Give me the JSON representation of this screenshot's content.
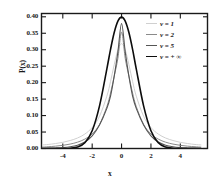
{
  "chart_data": {
    "type": "line",
    "title": "",
    "xlabel": "x",
    "ylabel": "P(x)",
    "xlim": [
      -5.45,
      5.85
    ],
    "ylim": [
      0.0,
      0.41
    ],
    "xticks": [
      -4,
      -2,
      0,
      2,
      4
    ],
    "xtick_labels": [
      "-4",
      "-2",
      "0",
      "2",
      "4"
    ],
    "yticks": [
      0.0,
      0.05,
      0.1,
      0.15,
      0.2,
      0.25,
      0.3,
      0.35,
      0.4
    ],
    "ytick_labels": [
      "0.00",
      "0.05",
      "0.10",
      "0.15",
      "0.20",
      "0.25",
      "0.30",
      "0.35",
      "0.40"
    ],
    "grid": false,
    "legend_position": "upper-right",
    "series": [
      {
        "name": "ν = 1",
        "nu": 1,
        "color": "#d0d0d0",
        "linewidth": 1.0,
        "peak": 0.3183,
        "x": [
          -5.4,
          -5.0,
          -4.5,
          -4.0,
          -3.5,
          -3.0,
          -2.5,
          -2.0,
          -1.5,
          -1.0,
          -0.75,
          -0.5,
          -0.25,
          0.0,
          0.25,
          0.5,
          0.75,
          1.0,
          1.5,
          2.0,
          2.5,
          3.0,
          3.5,
          4.0,
          4.5,
          5.0,
          5.4
        ],
        "y": [
          0.0108,
          0.0122,
          0.015,
          0.0187,
          0.0243,
          0.0318,
          0.0439,
          0.0637,
          0.0979,
          0.1592,
          0.2037,
          0.2546,
          0.2995,
          0.3183,
          0.2995,
          0.2546,
          0.2037,
          0.1592,
          0.0979,
          0.0637,
          0.0439,
          0.0318,
          0.0243,
          0.0187,
          0.015,
          0.0122,
          0.0108
        ]
      },
      {
        "name": "ν = 2",
        "nu": 2,
        "color": "#8a8a8a",
        "linewidth": 1.0,
        "peak": 0.3536,
        "x": [
          -5.4,
          -5.0,
          -4.5,
          -4.0,
          -3.5,
          -3.0,
          -2.5,
          -2.0,
          -1.5,
          -1.0,
          -0.75,
          -0.5,
          -0.25,
          0.0,
          0.25,
          0.5,
          0.75,
          1.0,
          1.5,
          2.0,
          2.5,
          3.0,
          3.5,
          4.0,
          4.5,
          5.0,
          5.4
        ],
        "y": [
          0.0042,
          0.0053,
          0.0071,
          0.0096,
          0.0134,
          0.0192,
          0.0285,
          0.0442,
          0.0731,
          0.1275,
          0.1686,
          0.2195,
          0.2736,
          0.3536,
          0.2736,
          0.2195,
          0.1686,
          0.1275,
          0.0731,
          0.0442,
          0.0285,
          0.0192,
          0.0134,
          0.0096,
          0.0071,
          0.0053,
          0.0042
        ]
      },
      {
        "name": "ν = 5",
        "nu": 5,
        "color": "#555555",
        "linewidth": 1.1,
        "peak": 0.3796,
        "x": [
          -5.4,
          -5.0,
          -4.5,
          -4.0,
          -3.5,
          -3.0,
          -2.5,
          -2.0,
          -1.5,
          -1.0,
          -0.75,
          -0.5,
          -0.25,
          0.0,
          0.25,
          0.5,
          0.75,
          1.0,
          1.5,
          2.0,
          2.5,
          3.0,
          3.5,
          4.0,
          4.5,
          5.0,
          5.4
        ],
        "y": [
          0.0007,
          0.001,
          0.0017,
          0.0028,
          0.0051,
          0.0098,
          0.0195,
          0.0384,
          0.0715,
          0.122,
          0.1592,
          0.2197,
          0.2934,
          0.3796,
          0.2934,
          0.2197,
          0.1592,
          0.122,
          0.0715,
          0.0384,
          0.0195,
          0.0098,
          0.0051,
          0.0028,
          0.0017,
          0.001,
          0.0007
        ]
      },
      {
        "name": "ν = + ∞",
        "nu": "infinity",
        "color": "#0d0d0d",
        "linewidth": 1.6,
        "peak": 0.3989,
        "x": [
          -5.4,
          -5.0,
          -4.5,
          -4.0,
          -3.5,
          -3.0,
          -2.5,
          -2.0,
          -1.5,
          -1.0,
          -0.75,
          -0.5,
          -0.25,
          0.0,
          0.25,
          0.5,
          0.75,
          1.0,
          1.5,
          2.0,
          2.5,
          3.0,
          3.5,
          4.0,
          4.5,
          5.0,
          5.4
        ],
        "y": [
          0.0,
          0.0,
          0.0,
          0.0001,
          0.0009,
          0.0044,
          0.0175,
          0.054,
          0.1295,
          0.242,
          0.3011,
          0.3521,
          0.3867,
          0.3989,
          0.3867,
          0.3521,
          0.3011,
          0.242,
          0.1295,
          0.054,
          0.0175,
          0.0044,
          0.0009,
          0.0001,
          0.0,
          0.0,
          0.0
        ]
      }
    ]
  },
  "axes": {
    "frame_color": "#1a1a1a"
  }
}
